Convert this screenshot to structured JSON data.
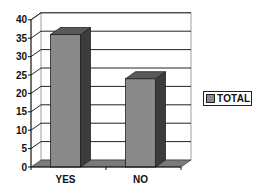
{
  "chart_data": {
    "type": "bar",
    "style": "3d-column",
    "title": "",
    "xlabel": "",
    "ylabel": "",
    "categories": [
      "YES",
      "NO"
    ],
    "series": [
      {
        "name": "TOTAL",
        "values": [
          36,
          24
        ],
        "color": "#8a8a8a"
      }
    ],
    "ylim": [
      0,
      40
    ],
    "yticks": [
      0,
      5,
      10,
      15,
      20,
      25,
      30,
      35,
      40
    ],
    "grid": true,
    "legend_position": "right"
  },
  "legend": {
    "items": [
      {
        "label": "TOTAL",
        "color": "#8a8a8a"
      }
    ]
  },
  "colors": {
    "bar_front": "#8a8a8a",
    "bar_side": "#3c3c3c",
    "bar_top": "#5a5a5a",
    "floor": "#7a7a7a",
    "grid": "#222222"
  }
}
